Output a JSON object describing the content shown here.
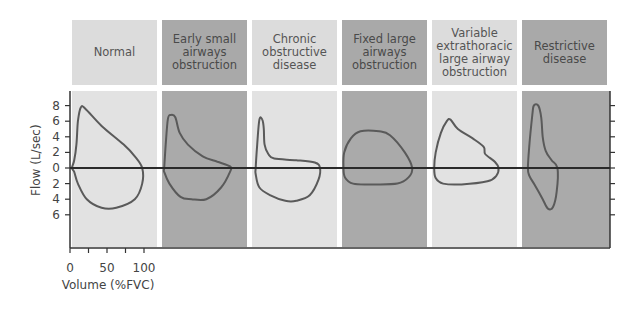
{
  "chart_data": {
    "type": "diagram",
    "title": "",
    "panels": [
      {
        "label": "Normal",
        "shade": "light"
      },
      {
        "label": "Early small airways obstruction",
        "shade": "dark"
      },
      {
        "label": "Chronic obstructive disease",
        "shade": "light"
      },
      {
        "label": "Fixed large airways obstruction",
        "shade": "dark"
      },
      {
        "label": "Variable extrathoracic large airway obstruction",
        "shade": "light"
      },
      {
        "label": "Restrictive disease",
        "shade": "dark"
      }
    ],
    "header_lines": [
      [
        "Normal"
      ],
      [
        "Early small",
        "airways",
        "obstruction"
      ],
      [
        "Chronic",
        "obstructive",
        "disease"
      ],
      [
        "Fixed large",
        "airways",
        "obstruction"
      ],
      [
        "Variable",
        "extrathoracic",
        "large airway",
        "obstruction"
      ],
      [
        "Restrictive",
        "disease"
      ]
    ],
    "ylabel": "Flow (L/sec)",
    "xlabel": "Volume (%FVC)",
    "y_ticks": [
      {
        "value": 8,
        "label": "8"
      },
      {
        "value": 6,
        "label": "6"
      },
      {
        "value": 4,
        "label": "4"
      },
      {
        "value": 2,
        "label": "2"
      },
      {
        "value": 0,
        "label": "0"
      },
      {
        "value": -2,
        "label": "2"
      },
      {
        "value": -4,
        "label": "4"
      },
      {
        "value": -6,
        "label": "6"
      }
    ],
    "x_ticks": [
      {
        "value": 0,
        "label": "0"
      },
      {
        "value": 25,
        "label": ""
      },
      {
        "value": 50,
        "label": "50"
      },
      {
        "value": 75,
        "label": ""
      },
      {
        "value": 100,
        "label": "100"
      }
    ],
    "ylim": [
      -10,
      9.5
    ],
    "xlim_per_panel": [
      0,
      115
    ],
    "loops": [
      {
        "name": "normal",
        "points": [
          [
            0,
            0
          ],
          [
            3,
            1
          ],
          [
            6,
            3
          ],
          [
            8,
            6
          ],
          [
            12,
            7.8
          ],
          [
            18,
            7.6
          ],
          [
            40,
            5.4
          ],
          [
            70,
            3
          ],
          [
            85,
            1.5
          ],
          [
            95,
            0
          ],
          [
            95,
            -2
          ],
          [
            85,
            -4
          ],
          [
            60,
            -5.1
          ],
          [
            40,
            -5.1
          ],
          [
            20,
            -4
          ],
          [
            8,
            -2
          ],
          [
            3,
            -0.5
          ],
          [
            0,
            0
          ]
        ]
      },
      {
        "name": "early-small-airways",
        "points": [
          [
            3,
            0
          ],
          [
            5,
            3
          ],
          [
            8,
            6.3
          ],
          [
            12,
            6.8
          ],
          [
            18,
            6.5
          ],
          [
            24,
            4.5
          ],
          [
            35,
            3
          ],
          [
            55,
            1.5
          ],
          [
            75,
            0.8
          ],
          [
            92,
            0.2
          ],
          [
            92,
            -0.5
          ],
          [
            80,
            -2.5
          ],
          [
            60,
            -4
          ],
          [
            40,
            -4
          ],
          [
            25,
            -3.7
          ],
          [
            10,
            -2
          ],
          [
            3,
            -0.5
          ],
          [
            3,
            0
          ]
        ]
      },
      {
        "name": "chronic-obstructive",
        "points": [
          [
            5,
            0
          ],
          [
            7,
            3
          ],
          [
            10,
            6.2
          ],
          [
            14,
            6.2
          ],
          [
            16,
            5
          ],
          [
            17,
            3
          ],
          [
            22,
            1.8
          ],
          [
            30,
            1.2
          ],
          [
            60,
            1
          ],
          [
            85,
            0.7
          ],
          [
            92,
            0
          ],
          [
            90,
            -1.5
          ],
          [
            78,
            -3.5
          ],
          [
            60,
            -4.2
          ],
          [
            45,
            -4.2
          ],
          [
            25,
            -3.5
          ],
          [
            10,
            -2.5
          ],
          [
            5,
            -0.8
          ],
          [
            5,
            0
          ]
        ]
      },
      {
        "name": "fixed-large-airways",
        "points": [
          [
            2,
            0
          ],
          [
            3,
            2
          ],
          [
            12,
            3.8
          ],
          [
            25,
            4.7
          ],
          [
            50,
            4.7
          ],
          [
            65,
            4.2
          ],
          [
            85,
            2
          ],
          [
            95,
            0
          ],
          [
            90,
            -1.2
          ],
          [
            75,
            -2
          ],
          [
            40,
            -2.1
          ],
          [
            15,
            -2
          ],
          [
            4,
            -1.2
          ],
          [
            2,
            0
          ]
        ]
      },
      {
        "name": "variable-extrathoracic",
        "points": [
          [
            3,
            0
          ],
          [
            5,
            2
          ],
          [
            12,
            4.5
          ],
          [
            20,
            6
          ],
          [
            25,
            6.2
          ],
          [
            35,
            5
          ],
          [
            55,
            3.8
          ],
          [
            70,
            2.7
          ],
          [
            72,
            1.8
          ],
          [
            85,
            0.8
          ],
          [
            90,
            0
          ],
          [
            87,
            -1
          ],
          [
            75,
            -1.7
          ],
          [
            40,
            -2.1
          ],
          [
            15,
            -2
          ],
          [
            5,
            -1.3
          ],
          [
            3,
            0
          ]
        ]
      },
      {
        "name": "restrictive",
        "points": [
          [
            8,
            0
          ],
          [
            10,
            3
          ],
          [
            14,
            6.8
          ],
          [
            16,
            8
          ],
          [
            22,
            8
          ],
          [
            26,
            6.5
          ],
          [
            28,
            4
          ],
          [
            32,
            2.2
          ],
          [
            40,
            1
          ],
          [
            48,
            0
          ],
          [
            47,
            -3
          ],
          [
            42,
            -5
          ],
          [
            35,
            -5.2
          ],
          [
            28,
            -4
          ],
          [
            18,
            -2.3
          ],
          [
            10,
            -1
          ],
          [
            8,
            0
          ]
        ]
      }
    ]
  }
}
